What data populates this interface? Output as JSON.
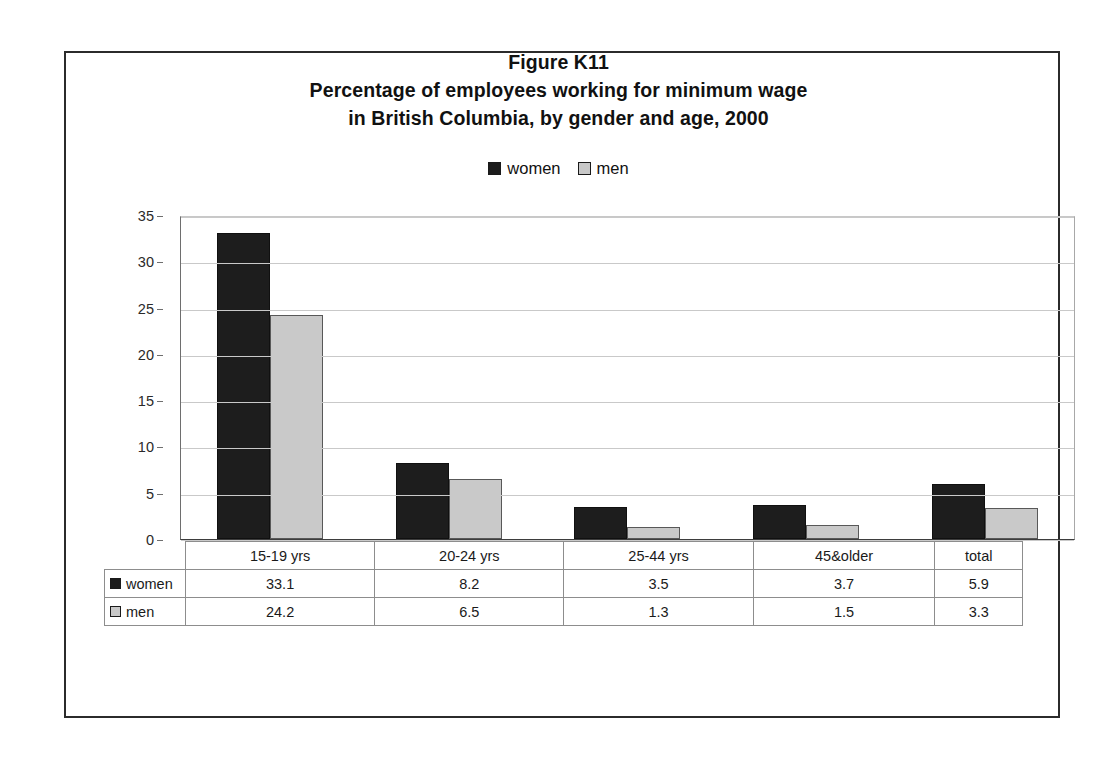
{
  "figure": {
    "title_lines": [
      "Figure K11",
      "Percentage of employees working for minimum wage",
      "in British Columbia, by gender and age, 2000"
    ]
  },
  "legend": {
    "items": [
      {
        "label": "women",
        "color": "#1c1c1c",
        "icon": "filled-square-icon"
      },
      {
        "label": "men",
        "color": "#c8c8c8",
        "icon": "filled-square-icon"
      }
    ]
  },
  "table": {
    "row_labels": [
      "women",
      "men"
    ],
    "header_cells": [
      "15-19 yrs",
      "20-24 yrs",
      "25-44 yrs",
      "45&older",
      "total"
    ],
    "rows": [
      {
        "label": "women",
        "values": [
          "33.1",
          "8.2",
          "3.5",
          "3.7",
          "5.9"
        ]
      },
      {
        "label": "men",
        "values": [
          "24.2",
          "6.5",
          "1.3",
          "1.5",
          "3.3"
        ]
      }
    ]
  },
  "chart_data": {
    "type": "bar",
    "xlabel": "",
    "ylabel": "",
    "categories": [
      "15-19 yrs",
      "20-24 yrs",
      "25-44 yrs",
      "45&older",
      "total"
    ],
    "series": [
      {
        "name": "women",
        "color": "#1c1c1c",
        "values": [
          33.1,
          8.2,
          3.5,
          3.7,
          5.9
        ]
      },
      {
        "name": "men",
        "color": "#c8c8c8",
        "values": [
          24.2,
          6.5,
          1.3,
          1.5,
          3.3
        ]
      }
    ],
    "ylim": [
      0,
      35
    ],
    "yticks": [
      0,
      5,
      10,
      15,
      20,
      25,
      30,
      35
    ],
    "ytick_labels": [
      "0",
      "5",
      "10",
      "15",
      "20",
      "25",
      "30",
      "35"
    ],
    "grid": true,
    "grid_axis": "y",
    "legend_position": "top-center",
    "data_table_below": true
  }
}
